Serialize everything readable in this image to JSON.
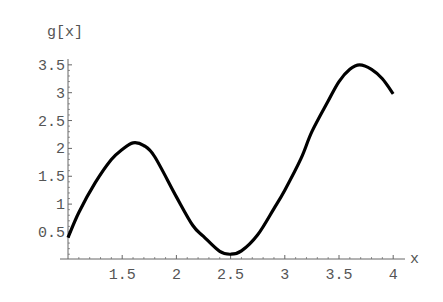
{
  "chart_data": {
    "type": "line",
    "title": "",
    "xlabel": "x",
    "ylabel": "g[x]",
    "xlim": [
      1,
      4.1
    ],
    "ylim": [
      0,
      3.6
    ],
    "grid": false,
    "legend": null,
    "x_ticks": [
      1.5,
      2,
      2.5,
      3,
      3.5,
      4
    ],
    "x_tick_labels": [
      "1.5",
      "2",
      "2.5",
      "3",
      "3.5",
      "4"
    ],
    "y_ticks": [
      0.5,
      1,
      1.5,
      2,
      2.5,
      3,
      3.5
    ],
    "y_tick_labels": [
      "0.5",
      "1",
      "1.5",
      "2",
      "2.5",
      "3",
      "3.5"
    ],
    "series": [
      {
        "name": "g[x]",
        "color": "#000000",
        "x": [
          1.0,
          1.1,
          1.25,
          1.4,
          1.5,
          1.6,
          1.7,
          1.8,
          2.0,
          2.15,
          2.25,
          2.4,
          2.5,
          2.6,
          2.75,
          2.9,
          3.0,
          3.15,
          3.25,
          3.4,
          3.5,
          3.6,
          3.69,
          3.8,
          3.9,
          4.0
        ],
        "values": [
          0.4,
          0.85,
          1.38,
          1.8,
          1.98,
          2.1,
          2.05,
          1.85,
          1.13,
          0.62,
          0.42,
          0.15,
          0.1,
          0.16,
          0.45,
          0.92,
          1.25,
          1.82,
          2.3,
          2.85,
          3.2,
          3.42,
          3.5,
          3.42,
          3.25,
          2.98
        ]
      }
    ]
  },
  "axes": {
    "x_label": "x",
    "y_label": "g[x]"
  }
}
